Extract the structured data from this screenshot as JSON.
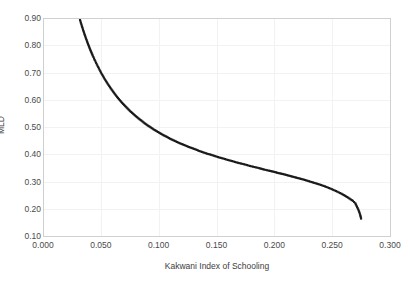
{
  "chart_data": {
    "type": "scatter",
    "title": "",
    "subtitle": "",
    "xlabel": "Kakwani Index of Schooling",
    "ylabel": "MLD",
    "xlim": [
      0.0,
      0.3
    ],
    "ylim": [
      0.1,
      0.9
    ],
    "grid": true,
    "legend": null,
    "marker_style": "small filled square",
    "marker_color": "#1a1a1a",
    "xticks": [
      0.0,
      0.05,
      0.1,
      0.15,
      0.2,
      0.25,
      0.3
    ],
    "xtick_labels": [
      "0.000",
      "0.050",
      "0.100",
      "0.150",
      "0.200",
      "0.250",
      "0.300"
    ],
    "yticks": [
      0.1,
      0.2,
      0.3,
      0.4,
      0.5,
      0.6,
      0.7,
      0.8,
      0.9
    ],
    "ytick_labels": [
      "0.10",
      "0.20",
      "0.30",
      "0.40",
      "0.50",
      "0.60",
      "0.70",
      "0.80",
      "0.90"
    ],
    "series": [
      {
        "name": "MLD vs Kakwani Index of Schooling",
        "x": [
          0.032,
          0.0335,
          0.035,
          0.0365,
          0.0381,
          0.0397,
          0.0413,
          0.043,
          0.0447,
          0.0465,
          0.0483,
          0.0501,
          0.052,
          0.0539,
          0.0559,
          0.0579,
          0.0599,
          0.062,
          0.0641,
          0.0663,
          0.0685,
          0.0708,
          0.0731,
          0.0754,
          0.0778,
          0.0802,
          0.0827,
          0.0852,
          0.0878,
          0.0904,
          0.093,
          0.0957,
          0.0985,
          0.1013,
          0.1041,
          0.107,
          0.1099,
          0.1129,
          0.1159,
          0.119,
          0.1221,
          0.1253,
          0.1285,
          0.1318,
          0.1351,
          0.1385,
          0.1419,
          0.1454,
          0.1489,
          0.1525,
          0.1561,
          0.1598,
          0.1635,
          0.1673,
          0.1711,
          0.175,
          0.1789,
          0.1829,
          0.1869,
          0.191,
          0.1951,
          0.1993,
          0.2035,
          0.2078,
          0.2121,
          0.2165,
          0.2209,
          0.2254,
          0.2299,
          0.2345,
          0.2391,
          0.2438,
          0.2485,
          0.2533,
          0.2581,
          0.263,
          0.2679,
          0.27,
          0.2715,
          0.273,
          0.2742,
          0.275
        ],
        "y": [
          0.893,
          0.872,
          0.852,
          0.833,
          0.814,
          0.796,
          0.779,
          0.762,
          0.746,
          0.73,
          0.715,
          0.7,
          0.686,
          0.672,
          0.659,
          0.646,
          0.634,
          0.622,
          0.61,
          0.599,
          0.588,
          0.578,
          0.568,
          0.558,
          0.549,
          0.54,
          0.531,
          0.523,
          0.514,
          0.506,
          0.499,
          0.491,
          0.484,
          0.477,
          0.47,
          0.464,
          0.457,
          0.451,
          0.445,
          0.439,
          0.434,
          0.428,
          0.423,
          0.418,
          0.412,
          0.407,
          0.402,
          0.398,
          0.393,
          0.388,
          0.384,
          0.379,
          0.375,
          0.37,
          0.366,
          0.362,
          0.357,
          0.353,
          0.349,
          0.344,
          0.34,
          0.336,
          0.331,
          0.327,
          0.322,
          0.317,
          0.312,
          0.307,
          0.301,
          0.295,
          0.289,
          0.282,
          0.274,
          0.265,
          0.255,
          0.243,
          0.229,
          0.22,
          0.207,
          0.193,
          0.178,
          0.164
        ]
      }
    ]
  }
}
